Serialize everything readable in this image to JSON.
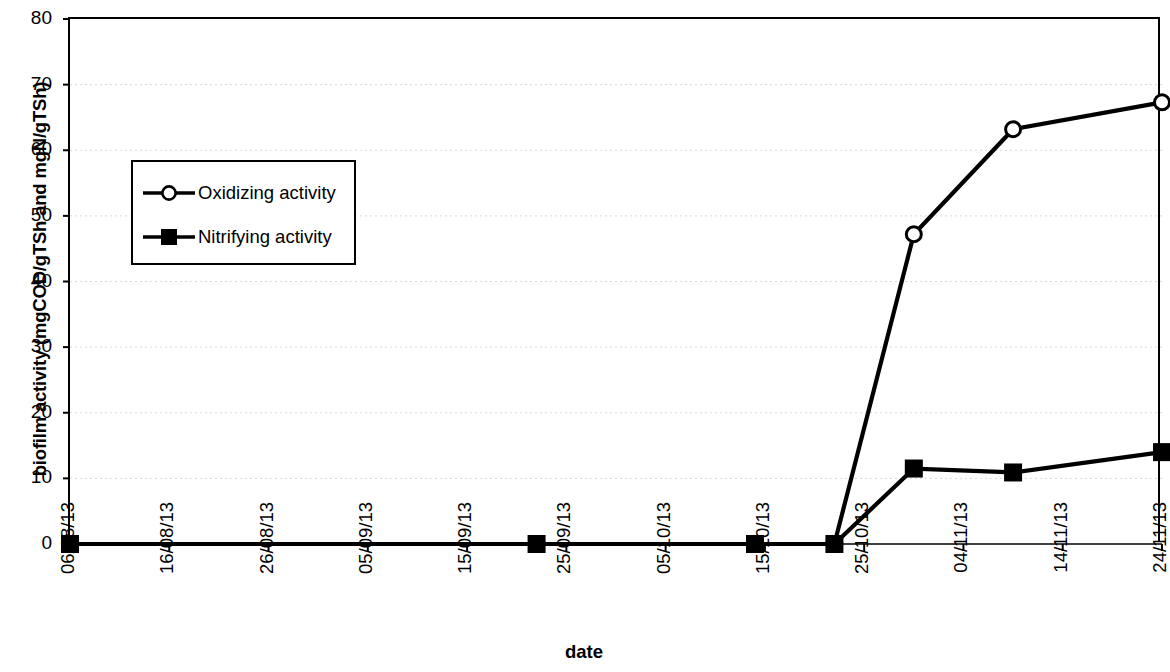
{
  "chart_data": {
    "type": "line",
    "title": "",
    "xlabel": "date",
    "ylabel": "biofilm activity (mgCOD/gTSh and mgN/gTSh)",
    "ylim": [
      0,
      80
    ],
    "ytick_labels": [
      "80",
      "70",
      "60",
      "50",
      "40",
      "30",
      "20",
      "10",
      "0"
    ],
    "ytick_values": [
      80,
      70,
      60,
      50,
      40,
      30,
      20,
      10,
      0
    ],
    "xtick_labels": [
      "06/08/13",
      "16/08/13",
      "26/08/13",
      "05/09/13",
      "15/09/13",
      "25/09/13",
      "05/10/13",
      "15/10/13",
      "25/10/13",
      "04/11/13",
      "14/11/13",
      "24/11/13"
    ],
    "xtick_days": [
      0,
      10,
      20,
      30,
      40,
      50,
      60,
      70,
      80,
      90,
      100,
      110
    ],
    "xlim_days": [
      0,
      110
    ],
    "grid": "horizontal-dotted",
    "legend_position": "upper-left-inside",
    "series": [
      {
        "name": "Oxidizing activity",
        "marker": "open-circle",
        "x_dates": [
          "06/08/13",
          "22/09/13",
          "14/10/13",
          "22/10/13",
          "29/10/13",
          "08/11/13",
          "23/11/13"
        ],
        "x_days": [
          0,
          47,
          69,
          77,
          85,
          95,
          110
        ],
        "values": [
          0,
          0,
          0,
          0,
          47.2,
          63.2,
          67.3
        ]
      },
      {
        "name": "Nitrifying activity",
        "marker": "filled-square",
        "x_dates": [
          "06/08/13",
          "22/09/13",
          "14/10/13",
          "22/10/13",
          "29/10/13",
          "08/11/13",
          "23/11/13"
        ],
        "x_days": [
          0,
          47,
          69,
          77,
          85,
          95,
          110
        ],
        "values": [
          0,
          0,
          0,
          0,
          11.5,
          10.9,
          14.0
        ]
      }
    ],
    "colors": {
      "line": "#000000",
      "marker_fill_open": "#ffffff",
      "marker_fill_solid": "#000000",
      "axis": "#000000",
      "grid": "#d9d9d9",
      "background": "#ffffff"
    }
  },
  "legend": {
    "items": [
      {
        "label": "Oxidizing activity",
        "marker": "open-circle"
      },
      {
        "label": "Nitrifying activity",
        "marker": "filled-square"
      }
    ]
  }
}
